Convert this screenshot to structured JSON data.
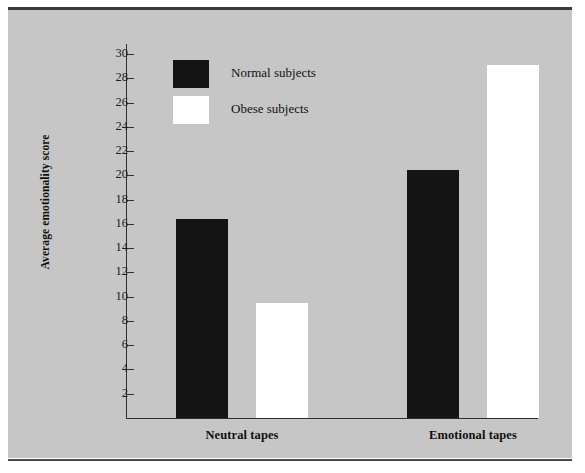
{
  "page": {
    "clipped_header_text": "",
    "background_color": "#ffffff",
    "panel_color": "#c6c6c6",
    "rule_color": "#3a3a3a"
  },
  "chart_data": {
    "type": "bar",
    "title": "",
    "subtitle": "",
    "xlabel": "",
    "ylabel": "Average emotionality score",
    "categories": [
      "Neutral tapes",
      "Emotional tapes"
    ],
    "series": [
      {
        "name": "Normal subjects",
        "color": "#141414",
        "values": [
          16.4,
          20.4
        ]
      },
      {
        "name": "Obese subjects",
        "color": "#ffffff",
        "values": [
          9.5,
          29.1
        ]
      }
    ],
    "ylim": [
      0,
      30
    ],
    "ytick_step": 2,
    "yticks": [
      30,
      28,
      26,
      24,
      22,
      20,
      18,
      16,
      14,
      12,
      10,
      8,
      6,
      4,
      2
    ],
    "ytick_labels": [
      "30",
      "28",
      "26",
      "24",
      "22",
      "20",
      "18",
      "16",
      "14",
      "12",
      "10",
      "8",
      "6",
      "4",
      "2"
    ],
    "grid": false,
    "legend_position": "upper-left-inside",
    "annotations": []
  },
  "legend": {
    "entries": [
      {
        "label": "Normal subjects",
        "swatch": "dark"
      },
      {
        "label": "Obese subjects",
        "swatch": "light"
      }
    ]
  },
  "axis": {
    "y_title": "Average emotionality score"
  },
  "categories": {
    "items": [
      {
        "label": "Neutral tapes"
      },
      {
        "label": "Emotional tapes"
      }
    ]
  }
}
